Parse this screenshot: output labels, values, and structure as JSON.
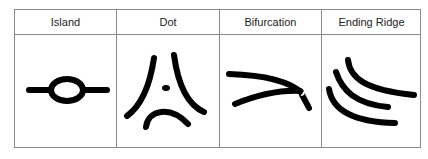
{
  "table": {
    "columns": [
      {
        "label": "Island",
        "figure": "island-ridge-icon"
      },
      {
        "label": "Dot",
        "figure": "dot-ridge-icon"
      },
      {
        "label": "Bifurcation",
        "figure": "bifurcation-ridge-icon"
      },
      {
        "label": "Ending Ridge",
        "figure": "ending-ridge-icon"
      }
    ]
  },
  "colors": {
    "border": "#8a8a8a",
    "ink": "#000000",
    "text": "#222222"
  }
}
